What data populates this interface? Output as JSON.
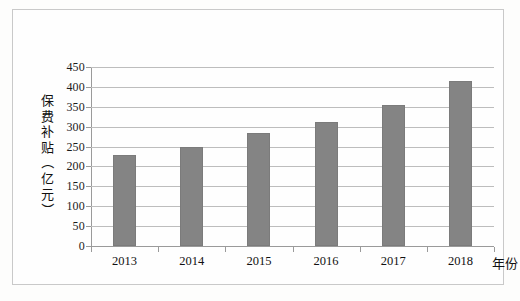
{
  "chart_data": {
    "type": "bar",
    "title": "",
    "categories": [
      "2013",
      "2014",
      "2015",
      "2016",
      "2017",
      "2018"
    ],
    "values": [
      228,
      248,
      283,
      311,
      354,
      416
    ],
    "series": [
      {
        "name": "保费补贴",
        "values": [
          228,
          248,
          283,
          311,
          354,
          416
        ]
      }
    ],
    "xlabel": "年份",
    "ylabel": "保费补贴（亿元）",
    "ylabel_chars": [
      "保",
      "费",
      "补",
      "贴",
      "（",
      "亿",
      "元",
      "）"
    ],
    "ylim": [
      0,
      450
    ],
    "ytick_labels": [
      "0",
      "50",
      "100",
      "150",
      "200",
      "250",
      "300",
      "350",
      "400",
      "450"
    ],
    "ytick_values": [
      0,
      50,
      100,
      150,
      200,
      250,
      300,
      350,
      400,
      450
    ],
    "ystep": 50,
    "grid": true,
    "legend": "none",
    "bar_color": "#848484",
    "gridline_color": "#bdbdbd",
    "axis_color": "#9a9a9a",
    "border_color": "#c9c9c9",
    "background_color": "#fefefe"
  }
}
